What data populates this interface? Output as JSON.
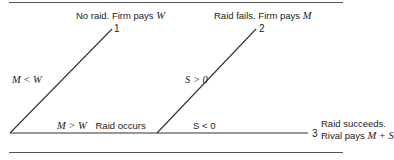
{
  "diagram": {
    "type": "decision-tree",
    "colors": {
      "line": "#333333",
      "rule": "#555555",
      "text": "#222222"
    },
    "nodes": [
      {
        "id": "1",
        "label": "1",
        "outcome_text": "No raid.  Firm pays ",
        "outcome_math": "W"
      },
      {
        "id": "2",
        "label": "2",
        "outcome_text": "Raid fails.  Firm pays ",
        "outcome_math": "M"
      },
      {
        "id": "3",
        "label": "3",
        "outcome_line1": "Raid succeeds.",
        "outcome_line2_text": "Rival pays ",
        "outcome_line2_math": "M + S"
      }
    ],
    "edges": [
      {
        "from": "root",
        "to": "1",
        "label_math": "M < W"
      },
      {
        "from": "root",
        "to": "split",
        "label_math": "M > W",
        "label_text": "Raid occurs"
      },
      {
        "from": "split",
        "to": "2",
        "label_math": "S > 0"
      },
      {
        "from": "split",
        "to": "3",
        "label_text": "S < 0"
      }
    ]
  }
}
